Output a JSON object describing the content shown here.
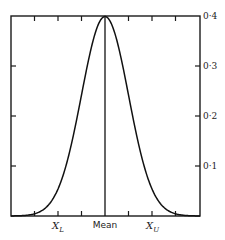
{
  "chart_data": {
    "type": "line",
    "title": "",
    "xlabel": "",
    "ylabel": "",
    "x_tick_labels": [
      {
        "label": "X_L",
        "main": "X",
        "sub": "L",
        "position_sd": -2
      },
      {
        "label": "Mean",
        "main": "Mean",
        "sub": "",
        "position_sd": 0
      },
      {
        "label": "X_U",
        "main": "X",
        "sub": "U",
        "position_sd": 2
      }
    ],
    "x_ticks_sd": [
      -3,
      -2,
      -1,
      0,
      1,
      2,
      3
    ],
    "xlim_sd": [
      -4,
      4
    ],
    "y_ticks": [
      {
        "value": 0.1,
        "label": "0·1"
      },
      {
        "value": 0.2,
        "label": "0·2"
      },
      {
        "value": 0.3,
        "label": "0·3"
      },
      {
        "value": 0.4,
        "label": "0·4"
      }
    ],
    "ylim": [
      0,
      0.4
    ],
    "y_axis_side": "right",
    "grid": false,
    "legend": null,
    "series": [
      {
        "name": "Normal density",
        "x": [
          -4,
          -3.5,
          -3,
          -2.5,
          -2,
          -1.5,
          -1,
          -0.5,
          0,
          0.5,
          1,
          1.5,
          2,
          2.5,
          3,
          3.5,
          4
        ],
        "values": [
          0.0001,
          0.0009,
          0.0044,
          0.0175,
          0.054,
          0.1295,
          0.242,
          0.3521,
          0.3989,
          0.3521,
          0.242,
          0.1295,
          0.054,
          0.0175,
          0.0044,
          0.0009,
          0.0001
        ]
      }
    ],
    "annotations": [
      {
        "type": "vertical-line",
        "at_sd": 0,
        "label": "Mean"
      }
    ]
  }
}
